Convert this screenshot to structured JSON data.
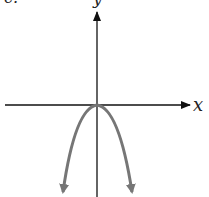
{
  "figure": {
    "part_label": "c.",
    "x_axis_label": "x",
    "y_axis_label": "y",
    "curve": {
      "type": "parabola",
      "opens": "down",
      "vertex": [
        0,
        0
      ],
      "equation_hint": "y = -a x^2",
      "color": "#767676"
    },
    "axis_color": "#111111"
  }
}
